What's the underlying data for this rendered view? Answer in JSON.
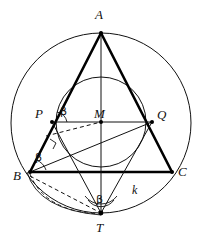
{
  "figure": {
    "background_color": "#ffffff",
    "stroke_color": "#111111",
    "heavy_stroke_color": "#000000"
  },
  "labels": {
    "vertex_a": "A",
    "vertex_b": "B",
    "vertex_c": "C",
    "point_p": "P",
    "point_q": "Q",
    "center_m": "M",
    "point_t": "T",
    "circle_k": "k",
    "angle_beta_at_p": "β",
    "angle_beta_at_b": "β",
    "angle_beta_at_t": "β"
  },
  "geometry": {
    "circumcircle": {
      "cx": 101,
      "cy": 123,
      "r": 90,
      "name": "circumcircle-k"
    },
    "incircle": {
      "cx": 101,
      "cy": 122,
      "r": 45,
      "name": "incircle"
    },
    "points": {
      "A": {
        "x": 101,
        "y": 33
      },
      "B": {
        "x": 30,
        "y": 172
      },
      "C": {
        "x": 172,
        "y": 172
      },
      "P": {
        "x": 52,
        "y": 122
      },
      "Q": {
        "x": 152,
        "y": 122
      },
      "M": {
        "x": 101,
        "y": 122
      },
      "T": {
        "x": 101,
        "y": 213
      }
    },
    "solid_segments": [
      {
        "name": "side-ab",
        "from": "A",
        "to": "B",
        "weight": "heavy"
      },
      {
        "name": "side-ac",
        "from": "A",
        "to": "C",
        "weight": "heavy"
      },
      {
        "name": "side-bc",
        "from": "B",
        "to": "C",
        "weight": "heavy"
      },
      {
        "name": "chord-pq",
        "from": "P",
        "to": "Q",
        "weight": "light"
      },
      {
        "name": "axis-at",
        "from": "A",
        "to": "T",
        "weight": "light"
      },
      {
        "name": "segment-pt",
        "from": "P",
        "to": "T",
        "weight": "light"
      },
      {
        "name": "segment-qt",
        "from": "Q",
        "to": "T",
        "weight": "light"
      },
      {
        "name": "segment-bq",
        "from": "B",
        "to": "Q",
        "weight": "light"
      }
    ],
    "dashed_segments": [
      {
        "name": "dashed-p-to-m",
        "from": "P",
        "to": "M"
      },
      {
        "name": "dashed-b-to-t",
        "from": "B",
        "to": "T"
      }
    ],
    "arcs": [
      {
        "name": "dashed-arc-b-t",
        "style": "dashed"
      },
      {
        "name": "solid-arc-b-t",
        "style": "solid"
      }
    ],
    "angle_marks": [
      {
        "name": "angle-mark-at-p",
        "kind": "arc",
        "at": "P"
      },
      {
        "name": "angle-mark-at-b",
        "kind": "arc",
        "at": "B"
      },
      {
        "name": "angle-mark-at-t",
        "kind": "double-arc",
        "at": "T"
      },
      {
        "name": "right-angle-mark-below-p",
        "kind": "square",
        "at": "P"
      }
    ]
  },
  "label_positions": {
    "A": {
      "left": 95,
      "top": 8
    },
    "B": {
      "left": 13,
      "top": 169
    },
    "C": {
      "left": 178,
      "top": 165
    },
    "P": {
      "left": 35,
      "top": 107
    },
    "Q": {
      "left": 157,
      "top": 108
    },
    "M": {
      "left": 94,
      "top": 107
    },
    "T": {
      "left": 96,
      "top": 221
    },
    "k": {
      "left": 132,
      "top": 184
    },
    "beta_p": {
      "left": 60,
      "top": 106
    },
    "beta_b": {
      "left": 35,
      "top": 152
    },
    "beta_t": {
      "left": 96,
      "top": 194
    }
  }
}
